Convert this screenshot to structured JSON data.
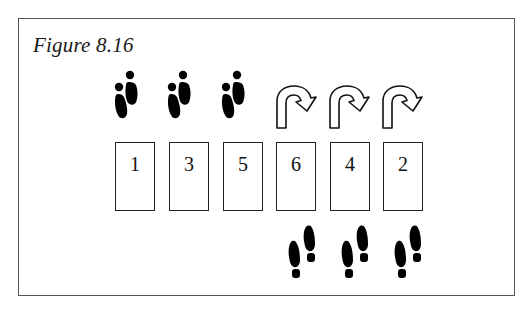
{
  "figure": {
    "title": "Figure 8.16"
  },
  "cards": [
    {
      "label": "1",
      "above": "footprints-forward",
      "below": null
    },
    {
      "label": "3",
      "above": "footprints-forward",
      "below": null
    },
    {
      "label": "5",
      "above": "footprints-forward",
      "below": null
    },
    {
      "label": "6",
      "above": "u-turn-arrow",
      "below": "footprints-backward"
    },
    {
      "label": "4",
      "above": "u-turn-arrow",
      "below": "footprints-backward"
    },
    {
      "label": "2",
      "above": "u-turn-arrow",
      "below": "footprints-backward"
    }
  ]
}
